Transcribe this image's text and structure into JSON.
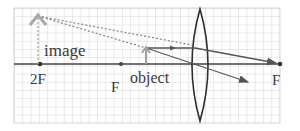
{
  "diagram": {
    "labels": {
      "image": "image",
      "object": "object",
      "two_f_left": "2F",
      "f_left": "F",
      "f_right": "F"
    },
    "colors": {
      "grid": "#c9c9c9",
      "axis": "#444444",
      "lens": "#2e2e2e",
      "ray": "#555555",
      "virtual_ray": "#8a8a8a",
      "image_arrow": "#a8a8a8",
      "object_arrow": "#a0a0a0",
      "text": "#3a3a3a"
    }
  }
}
